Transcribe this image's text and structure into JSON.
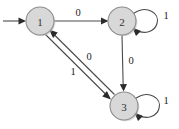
{
  "figure": {
    "background_color": "#ffffff",
    "width": 179,
    "height": 129
  },
  "style": {
    "node_fill": "#d8d8d8",
    "node_stroke": "#8c8c8c",
    "edge_color": "#4a4a4a",
    "arrow_color": "#2b2b2b",
    "label_color": "#1a1a1a"
  },
  "states": [
    {
      "id": "1",
      "label": "1",
      "cx": 40,
      "cy": 21,
      "r": 14,
      "is_start": true,
      "is_accepting": false
    },
    {
      "id": "2",
      "label": "2",
      "cx": 122,
      "cy": 21,
      "r": 14,
      "is_start": false,
      "is_accepting": false
    },
    {
      "id": "3",
      "label": "3",
      "cx": 124,
      "cy": 106,
      "r": 14,
      "is_start": false,
      "is_accepting": false
    }
  ],
  "start_marker": {
    "label": "",
    "from_x": 3,
    "to_x": 24,
    "y": 21
  },
  "transitions": [
    {
      "from": "1",
      "to": "2",
      "symbol": "0",
      "kind": "straight",
      "label_x": 78,
      "label_y": 12
    },
    {
      "from": "2",
      "to": "2",
      "symbol": "1",
      "kind": "self-loop",
      "label_x": 166,
      "label_y": 15
    },
    {
      "from": "2",
      "to": "3",
      "symbol": "0",
      "kind": "straight",
      "label_x": 131,
      "label_y": 60
    },
    {
      "from": "3",
      "to": "3",
      "symbol": "1",
      "kind": "self-loop",
      "label_x": 166,
      "label_y": 100
    },
    {
      "from": "1",
      "to": "3",
      "symbol": "1",
      "kind": "straight",
      "label_x": 73,
      "label_y": 71
    },
    {
      "from": "3",
      "to": "1",
      "symbol": "0",
      "kind": "straight",
      "label_x": 89,
      "label_y": 56
    }
  ],
  "labels": {
    "node_1": "1",
    "node_2": "2",
    "node_3": "3",
    "edge_1_to_2": "0",
    "edge_2_self": "1",
    "edge_2_to_3": "0",
    "edge_3_self": "1",
    "edge_1_to_3": "1",
    "edge_3_to_1": "0"
  }
}
